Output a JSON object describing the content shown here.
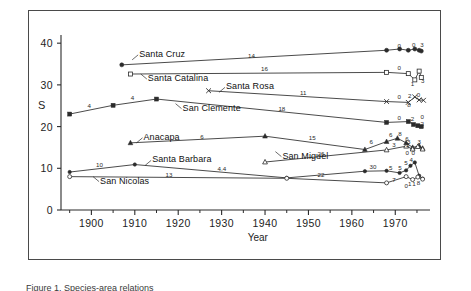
{
  "figure": {
    "caption_fragment": "Figure 1. Species-area relations"
  },
  "chart_data": {
    "type": "line",
    "title": "",
    "xlabel": "Year",
    "ylabel": "S",
    "xlim": [
      1893,
      1978
    ],
    "ylim": [
      0,
      41
    ],
    "grid": false,
    "legend_position": "inline-labels",
    "xticks": [
      1900,
      1910,
      1920,
      1930,
      1940,
      1950,
      1960,
      1970
    ],
    "xtick_labels": [
      "1900",
      "1910",
      "1920",
      "1930",
      "1940",
      "1950",
      "1960",
      "1970"
    ],
    "xminorticks": [
      1895,
      1905,
      1915,
      1925,
      1935,
      1945,
      1955,
      1965,
      1975
    ],
    "yticks": [
      0,
      10,
      20,
      30,
      40
    ],
    "ytick_labels": [
      "0",
      "10",
      "20",
      "30",
      "40"
    ],
    "series": [
      {
        "name": "Santa Cruz",
        "marker": "filled-circle",
        "label_x": 1911,
        "label_y": 37.2,
        "points": [
          {
            "x": 1907,
            "y": 34.8
          },
          {
            "x": 1968,
            "y": 38.3
          },
          {
            "x": 1971,
            "y": 38.6
          },
          {
            "x": 1973,
            "y": 38.3
          },
          {
            "x": 1974.5,
            "y": 38.6
          },
          {
            "x": 1975.5,
            "y": 38.3
          },
          {
            "x": 1976,
            "y": 38.1
          }
        ],
        "segment_labels": [
          {
            "x": 1937,
            "y": 37.0,
            "text": "14"
          }
        ],
        "point_numbers": [
          {
            "x": 1971,
            "y": 39.4,
            "text": "0"
          },
          {
            "x": 1974.3,
            "y": 39.5,
            "text": "0"
          },
          {
            "x": 1976.2,
            "y": 39.6,
            "text": "3"
          }
        ]
      },
      {
        "name": "Santa Catalina",
        "marker": "open-square",
        "label_x": 1913,
        "label_y": 31.4,
        "points": [
          {
            "x": 1909,
            "y": 32.6
          },
          {
            "x": 1968,
            "y": 33.0
          },
          {
            "x": 1973,
            "y": 32.7
          },
          {
            "x": 1974.5,
            "y": 31.2
          },
          {
            "x": 1975.5,
            "y": 33.3
          },
          {
            "x": 1976,
            "y": 31.8
          }
        ],
        "segment_labels": [
          {
            "x": 1940,
            "y": 33.7,
            "text": "16"
          }
        ],
        "point_numbers": [
          {
            "x": 1971,
            "y": 34.0,
            "text": "0"
          },
          {
            "x": 1974.0,
            "y": 30.2,
            "text": "1"
          },
          {
            "x": 1976.4,
            "y": 31.0,
            "text": "3"
          }
        ]
      },
      {
        "name": "Santa Rosa",
        "marker": "x-cross",
        "label_x": 1931,
        "label_y": 29.4,
        "points": [
          {
            "x": 1927,
            "y": 28.6
          },
          {
            "x": 1968,
            "y": 26.0
          },
          {
            "x": 1973,
            "y": 25.8
          },
          {
            "x": 1974.5,
            "y": 27.1
          },
          {
            "x": 1975.5,
            "y": 26.4
          },
          {
            "x": 1976.5,
            "y": 26.3
          }
        ],
        "segment_labels": [
          {
            "x": 1949,
            "y": 28.1,
            "text": "11"
          }
        ],
        "point_numbers": [
          {
            "x": 1971,
            "y": 27.0,
            "text": "0"
          },
          {
            "x": 1973.4,
            "y": 27.3,
            "text": "2"
          },
          {
            "x": 1973.2,
            "y": 25.1,
            "text": "8"
          },
          {
            "x": 1975.4,
            "y": 27.5,
            "text": "0"
          }
        ]
      },
      {
        "name": "San Clemente",
        "marker": "filled-square",
        "label_x": 1921,
        "label_y": 24.3,
        "points": [
          {
            "x": 1895,
            "y": 23.0
          },
          {
            "x": 1905,
            "y": 25.1
          },
          {
            "x": 1915,
            "y": 26.6
          },
          {
            "x": 1968,
            "y": 21.0
          },
          {
            "x": 1973,
            "y": 21.2
          },
          {
            "x": 1974.2,
            "y": 20.5
          },
          {
            "x": 1975.2,
            "y": 20.2
          },
          {
            "x": 1976,
            "y": 20.0
          }
        ],
        "segment_labels": [
          {
            "x": 1900,
            "y": 24.9,
            "text": "4"
          },
          {
            "x": 1910,
            "y": 26.8,
            "text": "4"
          },
          {
            "x": 1944,
            "y": 24.3,
            "text": "18"
          }
        ],
        "point_numbers": [
          {
            "x": 1971,
            "y": 22.0,
            "text": "0"
          },
          {
            "x": 1974.0,
            "y": 21.8,
            "text": "2"
          },
          {
            "x": 1976.3,
            "y": 22.2,
            "text": "0"
          },
          {
            "x": 1976.3,
            "y": 20.6,
            "text": "2"
          }
        ]
      },
      {
        "name": "Anacapa",
        "marker": "filled-triangle",
        "label_x": 1912,
        "label_y": 17.3,
        "points": [
          {
            "x": 1909,
            "y": 16.1
          },
          {
            "x": 1940,
            "y": 17.7
          },
          {
            "x": 1963,
            "y": 14.5
          },
          {
            "x": 1968,
            "y": 16.4
          },
          {
            "x": 1970.5,
            "y": 17.2
          },
          {
            "x": 1972.5,
            "y": 16.1
          },
          {
            "x": 1974,
            "y": 15.0
          },
          {
            "x": 1975.5,
            "y": 15.4
          },
          {
            "x": 1976.3,
            "y": 14.8
          }
        ],
        "segment_labels": [
          {
            "x": 1926,
            "y": 17.5,
            "text": "6"
          },
          {
            "x": 1951,
            "y": 17.2,
            "text": "15"
          },
          {
            "x": 1965,
            "y": 16.2,
            "text": "6"
          },
          {
            "x": 1969.5,
            "y": 18.0,
            "text": "6"
          },
          {
            "x": 1971.6,
            "y": 18.3,
            "text": "8"
          },
          {
            "x": 1973.2,
            "y": 17.0,
            "text": "6"
          },
          {
            "x": 1973.6,
            "y": 16.2,
            "text": "3"
          }
        ],
        "point_numbers": [
          {
            "x": 1972.8,
            "y": 13.6,
            "text": "0"
          },
          {
            "x": 1975.6,
            "y": 16.4,
            "text": "3"
          }
        ]
      },
      {
        "name": "San Miguel",
        "marker": "open-triangle",
        "label_x": 1944,
        "label_y": 12.8,
        "points": [
          {
            "x": 1940,
            "y": 11.5
          },
          {
            "x": 1968,
            "y": 14.4
          },
          {
            "x": 1972.5,
            "y": 15.3
          },
          {
            "x": 1974,
            "y": 14.6
          },
          {
            "x": 1975.2,
            "y": 15.2
          },
          {
            "x": 1976.3,
            "y": 14.6
          }
        ],
        "segment_labels": [
          {
            "x": 1953,
            "y": 13.5,
            "text": "26"
          },
          {
            "x": 1970.2,
            "y": 15.6,
            "text": "3"
          },
          {
            "x": 1973.4,
            "y": 15.6,
            "text": "5"
          }
        ],
        "point_numbers": [
          {
            "x": 1974.2,
            "y": 13.6,
            "text": "0"
          }
        ]
      },
      {
        "name": "Santa Barbara",
        "marker": "filled-circle-sm",
        "label_x": 1914,
        "label_y": 11.9,
        "points": [
          {
            "x": 1895,
            "y": 9.1
          },
          {
            "x": 1910,
            "y": 10.9
          },
          {
            "x": 1945,
            "y": 7.7
          },
          {
            "x": 1963,
            "y": 9.3
          },
          {
            "x": 1968,
            "y": 9.4
          },
          {
            "x": 1971,
            "y": 8.9
          },
          {
            "x": 1972.5,
            "y": 9.5
          },
          {
            "x": 1973.5,
            "y": 10.6
          },
          {
            "x": 1974.5,
            "y": 11.4
          },
          {
            "x": 1975.5,
            "y": 8.2
          },
          {
            "x": 1976.3,
            "y": 7.5
          }
        ],
        "segment_labels": [
          {
            "x": 1902,
            "y": 10.7,
            "text": "10"
          },
          {
            "x": 1930,
            "y": 9.8,
            "text": "4.4"
          },
          {
            "x": 1965,
            "y": 10.2,
            "text": "30"
          },
          {
            "x": 1969.5,
            "y": 10.0,
            "text": "5"
          },
          {
            "x": 1971.6,
            "y": 10.1,
            "text": "5"
          },
          {
            "x": 1973.0,
            "y": 11.2,
            "text": "5"
          },
          {
            "x": 1974.2,
            "y": 12.0,
            "text": "4"
          }
        ],
        "point_numbers": [
          {
            "x": 1973.4,
            "y": 6.3,
            "text": "1"
          },
          {
            "x": 1974.4,
            "y": 6.3,
            "text": "1"
          },
          {
            "x": 1975.4,
            "y": 6.4,
            "text": "8"
          }
        ]
      },
      {
        "name": "San Nicolas",
        "marker": "open-circle",
        "label_x": 1902,
        "label_y": 6.8,
        "points": [
          {
            "x": 1895,
            "y": 8.0
          },
          {
            "x": 1945,
            "y": 7.6
          },
          {
            "x": 1968,
            "y": 6.5
          },
          {
            "x": 1972.5,
            "y": 8.0
          },
          {
            "x": 1974,
            "y": 7.3
          },
          {
            "x": 1975.2,
            "y": 7.9
          },
          {
            "x": 1976.3,
            "y": 7.4
          }
        ],
        "segment_labels": [
          {
            "x": 1918,
            "y": 8.5,
            "text": "13"
          },
          {
            "x": 1953,
            "y": 8.5,
            "text": "22"
          },
          {
            "x": 1970.2,
            "y": 7.3,
            "text": "7"
          }
        ],
        "point_numbers": [
          {
            "x": 1972.6,
            "y": 5.8,
            "text": "0"
          }
        ]
      }
    ]
  }
}
